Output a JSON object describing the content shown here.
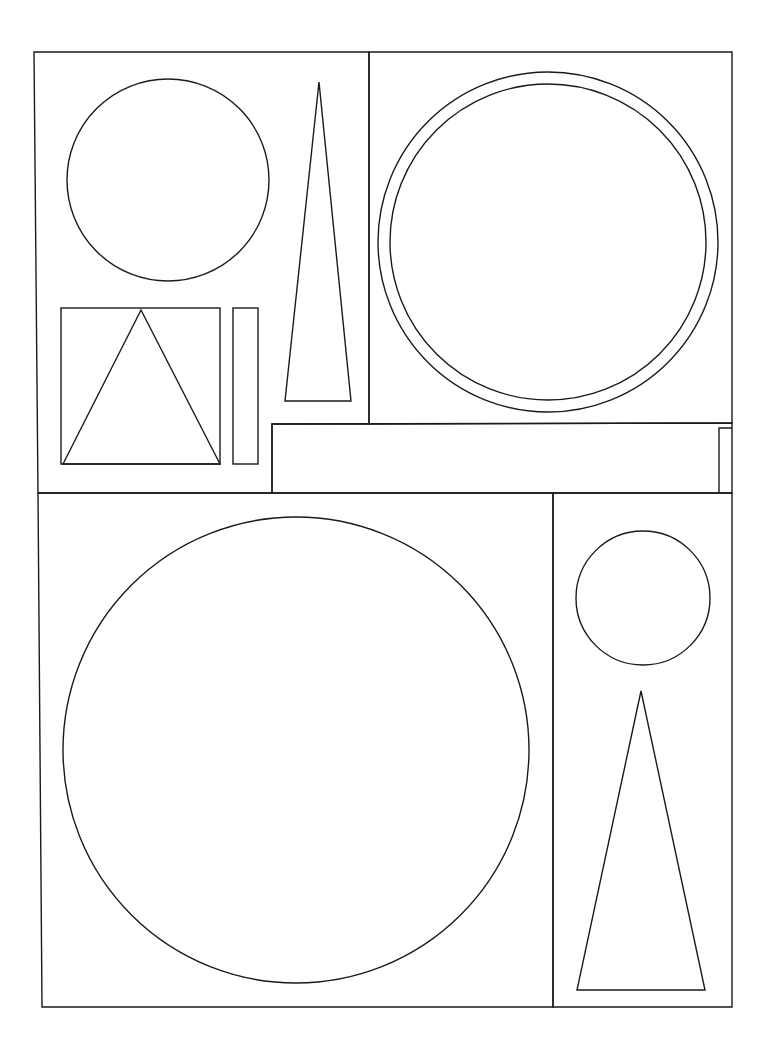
{
  "drawing": {
    "width": 767,
    "height": 1043,
    "stroke_color": "#1a1a1a",
    "background": "#ffffff",
    "panels": [
      {
        "name": "top-left-panel",
        "points": "34,52 369,52 369,424 272,424 272,493 38,493"
      },
      {
        "name": "top-right-panel",
        "points": "369,52 732,52 732,423 369,424"
      },
      {
        "name": "horizontal-bar",
        "points": "272,424 732,423 732,493 272,493"
      },
      {
        "name": "bar-step",
        "points": "719,493 719,428 732,428"
      },
      {
        "name": "bottom-left-panel",
        "points": "38,493 553,493 553,1007 42,1007"
      },
      {
        "name": "bottom-right-panel",
        "points": "553,493 732,493 732,1007 553,1007"
      }
    ],
    "circles": [
      {
        "name": "top-left-circle",
        "cx": 168,
        "cy": 180,
        "r": 101
      },
      {
        "name": "top-right-outer-circle",
        "cx": 548,
        "cy": 242,
        "r": 170
      },
      {
        "name": "top-right-inner-circle",
        "cx": 548,
        "cy": 242,
        "r": 158
      },
      {
        "name": "large-bottom-circle",
        "cx": 296,
        "cy": 750,
        "r": 233
      },
      {
        "name": "small-right-circle",
        "cx": 643,
        "cy": 598,
        "r": 67
      }
    ],
    "triangles": [
      {
        "name": "tall-narrow-triangle",
        "points": "319,82 285,401 351,401"
      },
      {
        "name": "square-inscribed-triangle",
        "points": "141,310 63,464 220,464"
      },
      {
        "name": "bottom-right-triangle",
        "points": "641,691 577,990 705,990"
      }
    ],
    "rectangles": [
      {
        "name": "square-frame",
        "x": 61,
        "y": 308,
        "w": 159,
        "h": 156
      },
      {
        "name": "thin-vertical-rectangle",
        "x": 233,
        "y": 308,
        "w": 25,
        "h": 156
      }
    ]
  }
}
